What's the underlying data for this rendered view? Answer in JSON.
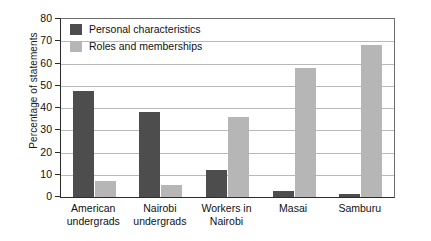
{
  "chart_data": {
    "type": "bar",
    "title": "",
    "subtitle": "",
    "xlabel": "",
    "ylabel": "Percentage of statements",
    "ylim": [
      0,
      80
    ],
    "ytick_step": 10,
    "yticks": [
      "80",
      "70",
      "60",
      "50",
      "40",
      "30",
      "20",
      "10",
      "0"
    ],
    "grid": true,
    "grid_axis": "y",
    "legend_position": "top-left inside plot",
    "categories": [
      "American undergrads",
      "Nairobi undergrads",
      "Workers in Nairobi",
      "Masai",
      "Samburu"
    ],
    "category_lines": [
      [
        "American",
        "undergrads"
      ],
      [
        "Nairobi",
        "undergrads"
      ],
      [
        "Workers in",
        "Nairobi"
      ],
      [
        "Masai",
        ""
      ],
      [
        "Samburu",
        ""
      ]
    ],
    "series": [
      {
        "name": "Personal characteristics",
        "color": "#4d4d4d",
        "values": [
          47.5,
          38,
          12,
          2.5,
          1.5
        ]
      },
      {
        "name": "Roles and memberships",
        "color": "#b6b6b6",
        "values": [
          7,
          5.5,
          36,
          58,
          68.5
        ]
      }
    ]
  },
  "colors": {
    "background": "#ffffff",
    "axis": "#2b2b2b",
    "gridline": "#b9b9b9",
    "text": "#111111",
    "series_dark": "#4d4d4d",
    "series_light": "#b6b6b6"
  }
}
